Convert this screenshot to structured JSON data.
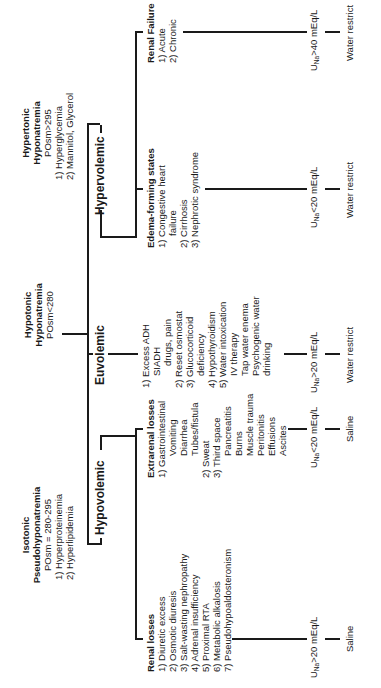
{
  "top_categories": {
    "isotonic": {
      "title_line1": "Isotonic",
      "title_line2": "Pseudohyponatremia",
      "posm": "POsm = 280-295",
      "items": [
        "1) Hyperproteinemia",
        "2) Hyperlipidemia"
      ]
    },
    "hypotonic": {
      "title_line1": "Hypotonic",
      "title_line2": "Hyponatremia",
      "posm": "POsm<280"
    },
    "hypertonic": {
      "title_line1": "Hypertonic",
      "title_line2": "Hyponatremia",
      "posm": "POsm>295",
      "items": [
        "1) Hyperglycemia",
        "2) Mannitol, Glycerol"
      ]
    }
  },
  "volume_states": {
    "hypovolemic": "Hypovolemic",
    "euvolemic": "Euvolemic",
    "hypervolemic": "Hypervolemic"
  },
  "branches": {
    "renal_losses": {
      "title": "Renal losses",
      "items": [
        "1) Diuretic excess",
        "2) Osmotic diuresis",
        "3) Salt-wasting nephropathy",
        "4) Adrenal insufficiency",
        "5) Proximal RTA",
        "6) Metabolic alkalosis",
        "7) Pseudohypoaldosteronism"
      ],
      "una_prefix": "U",
      "una_sub": "Na",
      "una_rest": ">20 mEq/L",
      "treatment": "Saline"
    },
    "extrarenal_losses": {
      "title": "Extrarenal losses",
      "items": [
        {
          "text": "1) Gastrointestinal",
          "indent": 0
        },
        {
          "text": "Vomiting",
          "indent": 2
        },
        {
          "text": "Diarrhea",
          "indent": 2
        },
        {
          "text": "Tubes/fistula",
          "indent": 2
        },
        {
          "text": "2) Sweat",
          "indent": 0
        },
        {
          "text": "3) Third space",
          "indent": 0
        },
        {
          "text": "Pancreatitis",
          "indent": 2
        },
        {
          "text": "Burns",
          "indent": 2
        },
        {
          "text": "Muscle trauma",
          "indent": 2
        },
        {
          "text": "Peritonitis",
          "indent": 2
        },
        {
          "text": "Effusions",
          "indent": 2
        },
        {
          "text": "Ascites",
          "indent": 2
        }
      ],
      "una_prefix": "U",
      "una_sub": "Na",
      "una_rest": "<20 mEq/L",
      "treatment": "Saline"
    },
    "euvolemic": {
      "items": [
        {
          "text": "1) Excess ADH",
          "indent": 0
        },
        {
          "text": "SIADH",
          "indent": 1
        },
        {
          "text": "drugs, pain",
          "indent": 2
        },
        {
          "text": "2) Reset osmostat",
          "indent": 0
        },
        {
          "text": "3) Glucocorticoid",
          "indent": 0
        },
        {
          "text": "deficiency",
          "indent": 1
        },
        {
          "text": "4) Hypothyroidism",
          "indent": 0
        },
        {
          "text": "5) Water intoxication",
          "indent": 0
        },
        {
          "text": "IV therapy",
          "indent": 1
        },
        {
          "text": "Tap water enema",
          "indent": 1
        },
        {
          "text": "Psychogenic water",
          "indent": 1
        },
        {
          "text": "drinking",
          "indent": 1
        }
      ],
      "una_prefix": "U",
      "una_sub": "Na",
      "una_rest": ">20 mEq/L",
      "treatment": "Water restrict"
    },
    "edema_forming": {
      "title": "Edema-forming states",
      "items": [
        {
          "text": "1) Congestive heart",
          "indent": 0
        },
        {
          "text": "failure",
          "indent": 1
        },
        {
          "text": "2) Cirrhosis",
          "indent": 0
        },
        {
          "text": "3) Nephrotic syndrome",
          "indent": 0
        }
      ],
      "una_prefix": "U",
      "una_sub": "Na",
      "una_rest": "<20 mEq/L",
      "treatment": "Water restrict"
    },
    "renal_failure": {
      "title": "Renal Failure",
      "items": [
        "1) Acute",
        "2) Chronic"
      ],
      "una_prefix": "U",
      "una_sub": "Na",
      "una_rest": ">40 mEq/L",
      "treatment": "Water restrict"
    }
  }
}
